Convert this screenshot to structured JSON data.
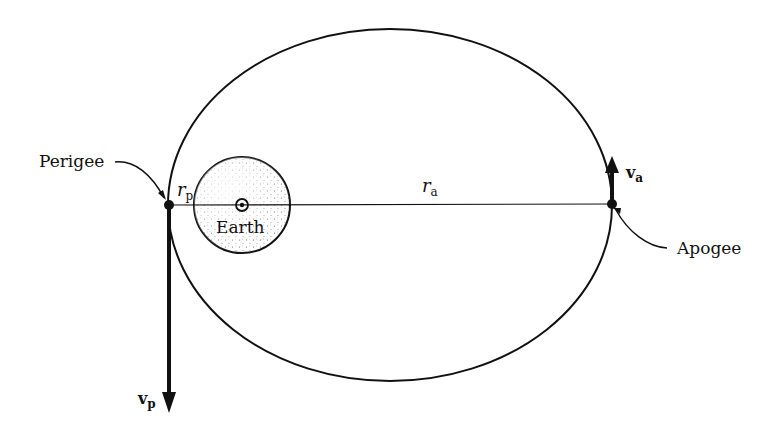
{
  "diagram": {
    "type": "elliptical-orbit",
    "labels": {
      "perigee": "Perigee",
      "apogee": "Apogee",
      "earth": "Earth",
      "r_p_main": "r",
      "r_p_sub": "p",
      "r_a_main": "r",
      "r_a_sub": "a",
      "v_p_main": "v",
      "v_p_sub": "p",
      "v_a_main": "v",
      "v_a_sub": "a"
    },
    "geometry": {
      "orbit": {
        "cx": 390,
        "cy": 205,
        "rx": 222,
        "ry": 176
      },
      "earth": {
        "cx": 242,
        "cy": 205,
        "r": 48
      },
      "perigee_point": {
        "x": 169,
        "y": 205
      },
      "apogee_point": {
        "x": 612,
        "y": 204
      },
      "v_p_arrow": {
        "x1": 169,
        "y1": 205,
        "x2": 169,
        "y2": 412
      },
      "v_a_arrow": {
        "x1": 612,
        "y1": 204,
        "x2": 612,
        "y2": 157
      }
    },
    "colors": {
      "line": "#111111",
      "earth_fill": "#f2f2f2",
      "background": "#ffffff"
    }
  }
}
